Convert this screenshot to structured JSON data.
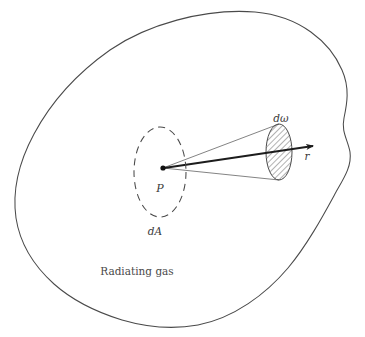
{
  "figure": {
    "type": "physics-diagram",
    "background_color": "#ffffff",
    "stroke_color": "#4a4a4a",
    "hatch_color": "#555555",
    "labels": {
      "point_p": "P",
      "area_element": "dA",
      "solid_angle": "dω",
      "radius_vector": "r",
      "medium": "Radiating gas"
    },
    "elements": {
      "outer_boundary_name": "radiating-gas-boundary",
      "dashed_ellipse_name": "area-element-dA-ellipse",
      "hatched_ellipse_name": "solid-angle-patch",
      "cone_name": "solid-angle-cone",
      "arrow_name": "radius-vector-arrow",
      "point_name": "point-p-marker"
    },
    "geometry": {
      "point_p": [
        163,
        168
      ],
      "dA_center": [
        160,
        172
      ],
      "dA_rx": 26,
      "dA_ry": 45,
      "patch_center": [
        279,
        152
      ],
      "patch_rx": 13,
      "patch_ry": 28,
      "arrow_tip": [
        317,
        145
      ],
      "blob_extent_x": [
        16,
        351
      ],
      "blob_extent_y": [
        12,
        326
      ]
    }
  }
}
